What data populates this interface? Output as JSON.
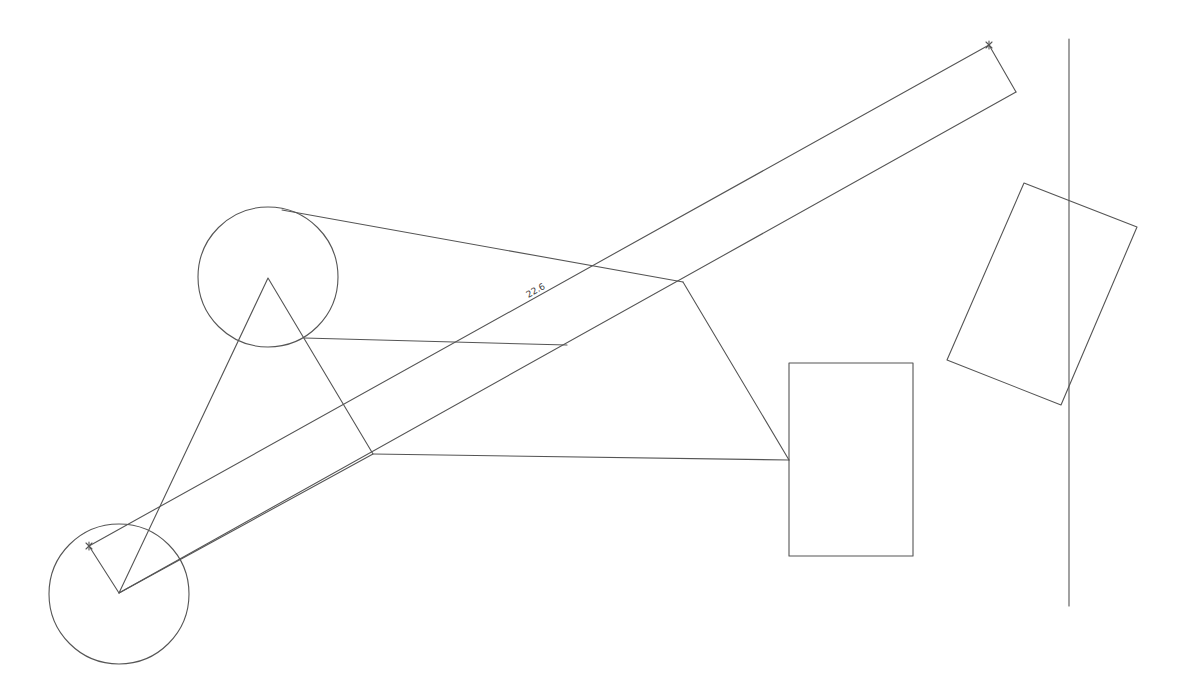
{
  "drawing": {
    "stroke_color": "#555555",
    "background": "#ffffff",
    "circles": [
      {
        "name": "upper-circle",
        "cx": 268,
        "cy": 277,
        "r": 70
      },
      {
        "name": "lower-circle",
        "cx": 119,
        "cy": 594,
        "r": 70
      }
    ],
    "triangle": {
      "points": "268,278 119,593 373,454"
    },
    "lines": [
      {
        "name": "tangent-line-top",
        "x1": 282,
        "y1": 210,
        "x2": 683,
        "y2": 282
      },
      {
        "name": "link-line-upper",
        "x1": 304,
        "y1": 338,
        "x2": 567,
        "y2": 345
      },
      {
        "name": "link-line-lower",
        "x1": 373,
        "y1": 454,
        "x2": 789,
        "y2": 460
      },
      {
        "name": "link-line-diagonal",
        "x1": 683,
        "y1": 282,
        "x2": 789,
        "y2": 460
      },
      {
        "name": "vertical-line",
        "x1": 1069,
        "y1": 39,
        "x2": 1069,
        "y2": 606
      }
    ],
    "dimension": {
      "value_label": "22.6",
      "label_x": 537,
      "label_y": 293,
      "angle": -29.1,
      "upper_line": {
        "x1": 89,
        "y1": 546,
        "x2": 989,
        "y2": 45
      },
      "lower_line": {
        "x1": 119,
        "y1": 593,
        "x2": 1016,
        "y2": 92
      },
      "ext_left": {
        "x1": 89,
        "y1": 546,
        "x2": 119,
        "y2": 593
      },
      "ext_right": {
        "x1": 989,
        "y1": 45,
        "x2": 1016,
        "y2": 92
      },
      "markers": [
        {
          "x": 89,
          "y": 546
        },
        {
          "x": 989,
          "y": 45
        }
      ]
    },
    "rectangles": [
      {
        "name": "upright-rectangle",
        "x": 789,
        "y": 363,
        "width": 124,
        "height": 193
      },
      {
        "name": "rotated-rectangle",
        "points": "1024,183 1137,227 1061,405 947,360"
      }
    ]
  }
}
